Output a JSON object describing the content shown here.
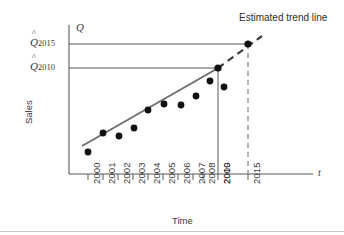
{
  "figure": {
    "background_color": "#ffffff",
    "axis_color": "#58595b",
    "trend_line_color": "#6d6e71",
    "point_color": "#111111",
    "guide_line_color": "#58595b",
    "forecast_line_style": "dashed"
  },
  "labels": {
    "y_axis_title": "Sales",
    "x_axis_title": "Time",
    "y_axis_symbol": "Q",
    "x_axis_symbol": "t",
    "annotation_trend": "Estimated trend line",
    "y_marker_upper_base": "Q",
    "y_marker_upper_sub": "2015",
    "y_marker_lower_base": "Q",
    "y_marker_lower_sub": "2010"
  },
  "chart_data": {
    "type": "scatter",
    "title": "",
    "subtitle": "",
    "xlabel": "Time",
    "ylabel": "Sales",
    "x_symbol": "t",
    "y_symbol": "Q",
    "grid": false,
    "legend": false,
    "x_tick_labels": [
      "2000",
      "2001",
      "2002",
      "2003",
      "2004",
      "2005",
      "2006",
      "2007",
      "2008",
      "2009",
      "2010",
      "2015"
    ],
    "x_tick_positions": [
      88,
      103,
      118,
      133,
      148,
      163,
      178,
      193,
      203,
      218,
      218,
      248
    ],
    "xlim": [
      2000,
      2015
    ],
    "ylim": [
      0,
      1
    ],
    "series": [
      {
        "name": "Observed sales",
        "type": "scatter",
        "x": [
          "2000",
          "2001",
          "2002",
          "2003",
          "2004",
          "2005",
          "2006",
          "2007",
          "2008",
          "2009"
        ],
        "values": [
          0.16,
          0.32,
          0.27,
          0.36,
          0.52,
          0.57,
          0.55,
          0.64,
          0.76,
          0.7
        ]
      },
      {
        "name": "Estimated trend line",
        "type": "line",
        "x": [
          "2000",
          "2010"
        ],
        "values": [
          0.2,
          0.8
        ],
        "style": "solid"
      },
      {
        "name": "Extrapolated trend",
        "type": "line",
        "x": [
          "2010",
          "2015"
        ],
        "values": [
          0.8,
          1.0
        ],
        "style": "dashed"
      }
    ],
    "forecast_points": [
      {
        "label": "2010",
        "value": 0.8,
        "marker": "filled-circle"
      },
      {
        "label": "2015",
        "value": 1.0,
        "marker": "filled-circle"
      }
    ],
    "annotations": [
      {
        "text": "Estimated trend line",
        "x": 240,
        "y": 18
      },
      {
        "text": "Q̂2015",
        "x": 30,
        "y": 36
      },
      {
        "text": "Q̂2010",
        "x": 30,
        "y": 62
      }
    ]
  }
}
